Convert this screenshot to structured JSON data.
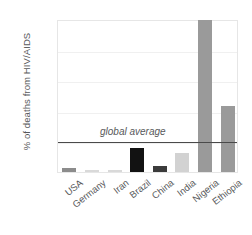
{
  "chart_data": {
    "type": "bar",
    "title": "",
    "xlabel": "",
    "ylabel": "% of deaths from HIV/AIDS",
    "ylim": [
      0,
      10
    ],
    "yticks": [
      0,
      2,
      4,
      6,
      8,
      10
    ],
    "ytick_labels": [
      "0",
      "2",
      "4",
      "6",
      "8",
      "10"
    ],
    "grid": true,
    "legend": "none",
    "categories": [
      "USA",
      "Germany",
      "Iran",
      "Brazil",
      "China",
      "India",
      "Nigeria",
      "Ethiopia"
    ],
    "values": [
      0.25,
      0.1,
      0.1,
      1.55,
      0.4,
      1.25,
      9.95,
      4.3
    ],
    "bar_colors": [
      "#8c8c8c",
      "#d9d9d9",
      "#d9d9d9",
      "#121212",
      "#3b3b3b",
      "#d2d2d2",
      "#9a9a9a",
      "#9a9a9a"
    ],
    "annotations": [
      {
        "name": "global-average",
        "label": "global average",
        "value": 2.1,
        "color": "#4a4a4a",
        "style": "horizontal-line"
      }
    ]
  }
}
